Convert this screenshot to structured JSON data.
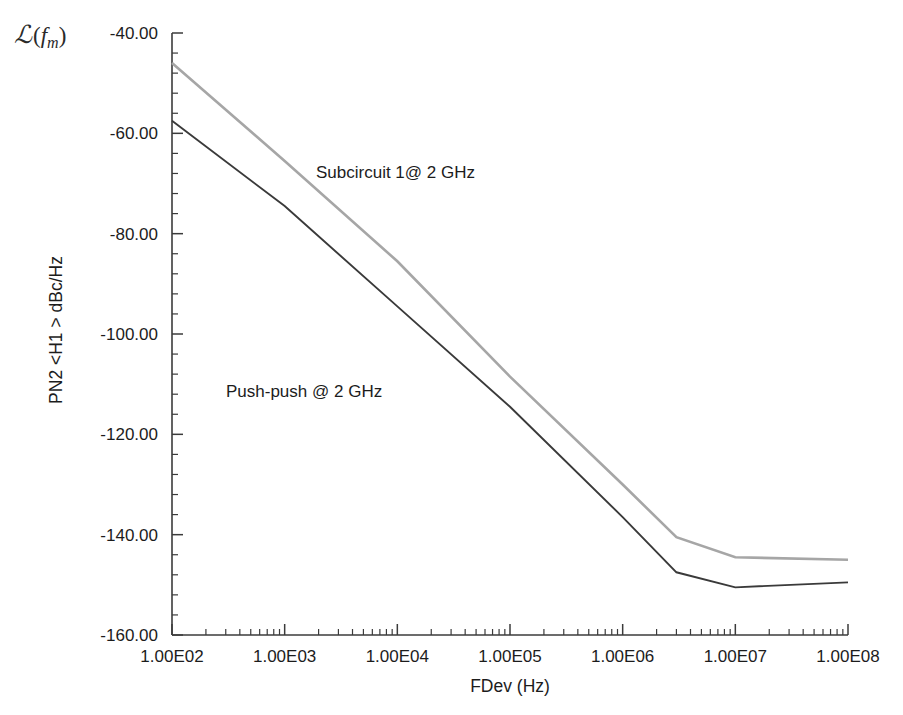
{
  "figure": {
    "corner_symbol": {
      "script_l": "ℒ",
      "open_paren": "(",
      "f_var": "f",
      "subscript": "m",
      "close_paren": ")"
    },
    "background_color": "#ffffff"
  },
  "chart_data": {
    "type": "line",
    "title": "",
    "xlabel": "FDev (Hz)",
    "ylabel": "PN2 <H1 > dBc/Hz",
    "xscale": "log",
    "yscale": "linear",
    "xlim": [
      100,
      100000000
    ],
    "ylim": [
      -160,
      -40
    ],
    "grid": false,
    "legend": "none (inline annotations)",
    "xticks": [
      "1.00E02",
      "1.00E03",
      "1.00E04",
      "1.00E05",
      "1.00E06",
      "1.00E07",
      "1.00E08"
    ],
    "xtick_values": [
      100,
      1000,
      10000,
      100000,
      1000000,
      10000000,
      100000000
    ],
    "yticks": [
      "-40.00",
      "-60.00",
      "-80.00",
      "-100.00",
      "-120.00",
      "-140.00",
      "-160.00"
    ],
    "ytick_values": [
      -40,
      -60,
      -80,
      -100,
      -120,
      -140,
      -160
    ],
    "minor_ticks_per_decade": 9,
    "y_minor_ticks_per_interval": 4,
    "series": [
      {
        "name": "Subcircuit 1@ 2 GHz",
        "color": "#a6a6a6",
        "line_width": 2.6,
        "annotation_label": "Subcircuit 1@ 2 GHz",
        "x": [
          100,
          1000,
          10000,
          100000,
          1000000,
          3000000,
          10000000,
          100000000
        ],
        "y": [
          -46.0,
          -65.5,
          -85.5,
          -108.5,
          -130.0,
          -140.5,
          -144.5,
          -145.0
        ]
      },
      {
        "name": "Push-push @ 2 GHz",
        "color": "#3a3a3a",
        "line_width": 1.9,
        "annotation_label": "Push-push @ 2 GHz",
        "x": [
          100,
          1000,
          10000,
          100000,
          1000000,
          3000000,
          10000000,
          100000000
        ],
        "y": [
          -57.5,
          -74.5,
          -94.5,
          -114.5,
          -136.5,
          -147.5,
          -150.5,
          -149.5
        ]
      }
    ],
    "annotations": [
      {
        "text": "Subcircuit 1@ 2 GHz",
        "x_px": 316,
        "y_px": 178
      },
      {
        "text": "Push-push @ 2 GHz",
        "x_px": 226,
        "y_px": 397
      }
    ]
  }
}
